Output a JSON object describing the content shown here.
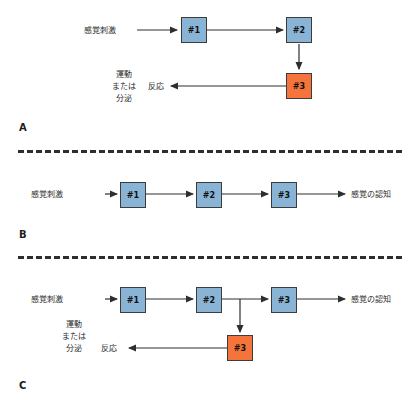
{
  "figure": {
    "background": "#ffffff",
    "blue_node_color": "#8ab4d6",
    "orange_node_color": "#f4743b",
    "line_color": "#2e2e2e",
    "bottom_caption": ""
  },
  "labels": {
    "sensory_stimulus": "感覚刺激",
    "sensory_perception": "感覚の認知",
    "response": "反応",
    "motor_line1": "運動",
    "motor_line2": "または",
    "motor_line3": "分泌"
  },
  "panels": [
    {
      "letter": "A",
      "nodes": [
        {
          "label": "#1",
          "color": "blue"
        },
        {
          "label": "#2",
          "color": "blue"
        },
        {
          "label": "#3",
          "color": "orange"
        }
      ]
    },
    {
      "letter": "B",
      "nodes": [
        {
          "label": "#1",
          "color": "blue"
        },
        {
          "label": "#2",
          "color": "blue"
        },
        {
          "label": "#3",
          "color": "blue"
        }
      ]
    },
    {
      "letter": "C",
      "nodes": [
        {
          "label": "#1",
          "color": "blue"
        },
        {
          "label": "#2",
          "color": "blue"
        },
        {
          "label": "#3",
          "color": "blue"
        },
        {
          "label": "#3",
          "color": "orange"
        }
      ]
    }
  ]
}
